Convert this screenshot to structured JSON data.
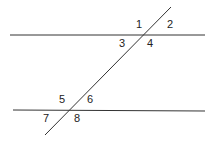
{
  "diagram": {
    "type": "parallel-lines-cut-by-transversal",
    "stroke_color": "#333333",
    "lines": {
      "top": {
        "x1": 10,
        "y1": 35,
        "x2": 205,
        "y2": 35
      },
      "bottom": {
        "x1": 13,
        "y1": 110,
        "x2": 205,
        "y2": 111
      },
      "transversal": {
        "x1": 171,
        "y1": 7,
        "x2": 45,
        "y2": 135
      }
    },
    "angle_labels": [
      {
        "text": "1",
        "x": 136,
        "y": 28
      },
      {
        "text": "2",
        "x": 167,
        "y": 28
      },
      {
        "text": "3",
        "x": 119,
        "y": 47
      },
      {
        "text": "4",
        "x": 147,
        "y": 47
      },
      {
        "text": "5",
        "x": 59,
        "y": 103
      },
      {
        "text": "6",
        "x": 87,
        "y": 103
      },
      {
        "text": "7",
        "x": 43,
        "y": 122
      },
      {
        "text": "8",
        "x": 74,
        "y": 122
      }
    ]
  }
}
